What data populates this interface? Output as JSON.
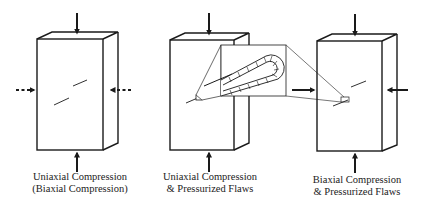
{
  "colors": {
    "line": "#1a1a1a",
    "background": "#ffffff",
    "caption": "#222222"
  },
  "panels": [
    {
      "id": "uniaxial",
      "caption_line1": "Uniaxial Compression",
      "caption_line2": "(Biaxial Compression)",
      "lateral_arrows": "dotted",
      "flaws": 2
    },
    {
      "id": "uniaxial-pressurized",
      "caption_line1": "Uniaxial Compression",
      "caption_line2": "& Pressurized Flaws",
      "lateral_arrows": "none",
      "flaws": 2,
      "callout": "pressurized-flaw-detail"
    },
    {
      "id": "biaxial-pressurized",
      "caption_line1": "Biaxial Compression",
      "caption_line2": "& Pressurized Flaws",
      "lateral_arrows": "solid",
      "flaws": 2
    }
  ]
}
